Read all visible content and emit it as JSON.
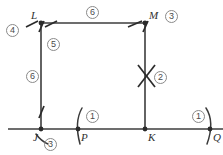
{
  "diagram": {
    "type": "geometry-construction",
    "canvas": {
      "width": 223,
      "height": 155,
      "background": "#ffffff"
    },
    "stroke_color": "#3d3d3d",
    "label_color": "#303030",
    "circle_number_color": "#4a4a4a",
    "points": [
      {
        "id": "L",
        "label": "L",
        "x": 41,
        "y": 23,
        "label_x": 31,
        "label_y": 10
      },
      {
        "id": "M",
        "label": "M",
        "x": 145,
        "y": 23,
        "label_x": 149,
        "label_y": 10
      },
      {
        "id": "J",
        "label": "J",
        "x": 41,
        "y": 129,
        "label_x": 33,
        "label_y": 132
      },
      {
        "id": "P",
        "label": "P",
        "x": 78,
        "y": 129,
        "label_x": 81,
        "label_y": 132
      },
      {
        "id": "K",
        "label": "K",
        "x": 145,
        "y": 129,
        "label_x": 148,
        "label_y": 132
      },
      {
        "id": "Q",
        "label": "Q",
        "x": 210,
        "y": 129,
        "label_x": 213,
        "label_y": 132
      }
    ],
    "segments": [
      {
        "name": "baseline-JQ",
        "x1": 8,
        "y1": 129,
        "x2": 223,
        "y2": 129
      },
      {
        "name": "top-LM",
        "x1": 41,
        "y1": 23,
        "x2": 145,
        "y2": 23
      },
      {
        "name": "left-LJ",
        "x1": 41,
        "y1": 23,
        "x2": 41,
        "y2": 129
      },
      {
        "name": "right-MK",
        "x1": 145,
        "y1": 23,
        "x2": 145,
        "y2": 129
      }
    ],
    "circled_numbers": [
      {
        "value": "4",
        "name": "step-4-badge",
        "x": 6,
        "y": 24
      },
      {
        "value": "6",
        "name": "step-6-top-badge",
        "x": 86,
        "y": 6
      },
      {
        "value": "3",
        "name": "step-3-top-badge",
        "x": 165,
        "y": 10
      },
      {
        "value": "5",
        "name": "step-5-badge",
        "x": 47,
        "y": 38
      },
      {
        "value": "6",
        "name": "step-6-left-badge",
        "x": 26,
        "y": 70
      },
      {
        "value": "2",
        "name": "step-2-badge",
        "x": 154,
        "y": 71
      },
      {
        "value": "3",
        "name": "step-3-bottom-badge",
        "x": 44,
        "y": 138
      },
      {
        "value": "1",
        "name": "step-1-left-badge",
        "x": 86,
        "y": 110
      },
      {
        "value": "1",
        "name": "step-1-right-badge",
        "x": 192,
        "y": 110
      }
    ],
    "tick_marks": [
      {
        "name": "tick-L-top-left",
        "x1": 26,
        "y1": 27,
        "x2": 38,
        "y2": 21
      },
      {
        "name": "tick-L-top-right",
        "x1": 45,
        "y1": 27,
        "x2": 57,
        "y2": 21
      },
      {
        "name": "tick-L-vertical",
        "x1": 39,
        "y1": 32,
        "x2": 44,
        "y2": 21
      },
      {
        "name": "tick-M-top-left",
        "x1": 128,
        "y1": 27,
        "x2": 142,
        "y2": 21
      },
      {
        "name": "tick-M-vertical",
        "x1": 143,
        "y1": 32,
        "x2": 148,
        "y2": 21
      },
      {
        "name": "tick-J-vertical",
        "x1": 39,
        "y1": 118,
        "x2": 44,
        "y2": 106
      },
      {
        "name": "x-mark-stroke-a",
        "x1": 138,
        "y1": 65,
        "x2": 155,
        "y2": 87
      },
      {
        "name": "x-mark-stroke-b",
        "x1": 155,
        "y1": 65,
        "x2": 138,
        "y2": 87
      }
    ],
    "arc_marks": [
      {
        "name": "arc-at-J",
        "d": "M 36 134 Q 41 141 48 144"
      },
      {
        "name": "arc-at-P",
        "d": "M 82 108 Q 74 122 80 144"
      },
      {
        "name": "arc-at-Q",
        "d": "M 206 108 Q 215 122 207 144"
      }
    ],
    "ghost_artifact": {
      "text": "",
      "x": 60,
      "y": 0
    }
  }
}
